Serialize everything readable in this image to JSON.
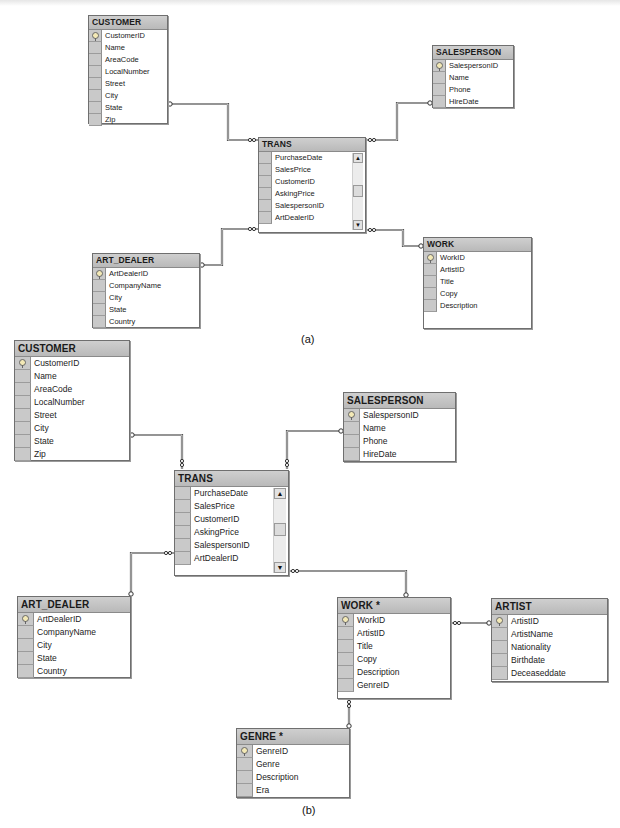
{
  "diagram_a": {
    "caption": "(a)",
    "tables": {
      "customer": {
        "name": "CUSTOMER",
        "columns": [
          "CustomerID",
          "Name",
          "AreaCode",
          "LocalNumber",
          "Street",
          "City",
          "State",
          "Zip"
        ],
        "primary_key": "CustomerID"
      },
      "salesperson": {
        "name": "SALESPERSON",
        "columns": [
          "SalespersonID",
          "Name",
          "Phone",
          "HireDate"
        ],
        "primary_key": "SalespersonID"
      },
      "trans": {
        "name": "TRANS",
        "columns": [
          "PurchaseDate",
          "SalesPrice",
          "CustomerID",
          "AskingPrice",
          "SalespersonID",
          "ArtDealerID"
        ],
        "scroll_up": "▲",
        "scroll_down": "▼"
      },
      "art_dealer": {
        "name": "ART_DEALER",
        "columns": [
          "ArtDealerID",
          "CompanyName",
          "City",
          "State",
          "Country"
        ],
        "primary_key": "ArtDealerID"
      },
      "work": {
        "name": "WORK",
        "columns": [
          "WorkID",
          "ArtistID",
          "Title",
          "Copy",
          "Description"
        ],
        "primary_key": "WorkID"
      }
    },
    "relationships": [
      {
        "from": "CUSTOMER",
        "to": "TRANS"
      },
      {
        "from": "SALESPERSON",
        "to": "TRANS"
      },
      {
        "from": "ART_DEALER",
        "to": "TRANS"
      },
      {
        "from": "WORK",
        "to": "TRANS"
      }
    ]
  },
  "diagram_b": {
    "caption": "(b)",
    "tables": {
      "customer": {
        "name": "CUSTOMER",
        "columns": [
          "CustomerID",
          "Name",
          "AreaCode",
          "LocalNumber",
          "Street",
          "City",
          "State",
          "Zip"
        ],
        "primary_key": "CustomerID"
      },
      "salesperson": {
        "name": "SALESPERSON",
        "columns": [
          "SalespersonID",
          "Name",
          "Phone",
          "HireDate"
        ],
        "primary_key": "SalespersonID"
      },
      "trans": {
        "name": "TRANS",
        "columns": [
          "PurchaseDate",
          "SalesPrice",
          "CustomerID",
          "AskingPrice",
          "SalespersonID",
          "ArtDealerID"
        ],
        "scroll_up": "▲",
        "scroll_down": "▼"
      },
      "art_dealer": {
        "name": "ART_DEALER",
        "columns": [
          "ArtDealerID",
          "CompanyName",
          "City",
          "State",
          "Country"
        ],
        "primary_key": "ArtDealerID"
      },
      "work": {
        "name": "WORK *",
        "columns": [
          "WorkID",
          "ArtistID",
          "Title",
          "Copy",
          "Description",
          "GenreID"
        ],
        "primary_key": "WorkID"
      },
      "artist": {
        "name": "ARTIST",
        "columns": [
          "ArtistID",
          "ArtistName",
          "Nationality",
          "Birthdate",
          "Deceaseddate"
        ],
        "primary_key": "ArtistID"
      },
      "genre": {
        "name": "GENRE *",
        "columns": [
          "GenreID",
          "Genre",
          "Description",
          "Era"
        ],
        "primary_key": "GenreID"
      }
    },
    "relationships": [
      {
        "from": "CUSTOMER",
        "to": "TRANS"
      },
      {
        "from": "SALESPERSON",
        "to": "TRANS"
      },
      {
        "from": "ART_DEALER",
        "to": "TRANS"
      },
      {
        "from": "WORK *",
        "to": "TRANS"
      },
      {
        "from": "ARTIST",
        "to": "WORK *"
      },
      {
        "from": "GENRE *",
        "to": "WORK *"
      }
    ]
  },
  "icons": {
    "primary_key": "key-icon",
    "scroll_up": "scroll-up-arrow-icon",
    "scroll_down": "scroll-down-arrow-icon"
  },
  "colors": {
    "header_bg": "#c2c2c2",
    "selector_bg": "#c9c9c9",
    "border": "#6f6f6f",
    "line": "#555555"
  }
}
